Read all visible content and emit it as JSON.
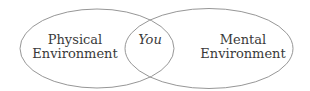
{
  "diagram": {
    "type": "venn",
    "circles": [
      {
        "id": "left",
        "label_line1": "Physical",
        "label_line2": "Environment"
      },
      {
        "id": "right",
        "label_line1": "Mental",
        "label_line2": "Environment"
      }
    ],
    "intersection": {
      "label": "You"
    },
    "stroke_color": "#8a8a8a",
    "text_color": "#3a3a3a"
  }
}
